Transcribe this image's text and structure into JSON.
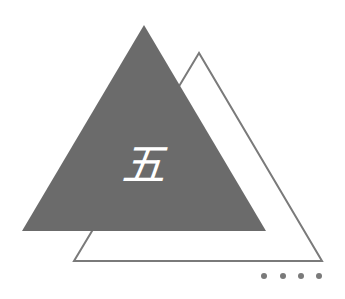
{
  "figure": {
    "character": "五",
    "colors": {
      "background": "#ffffff",
      "filled_triangle": "#6b6b6b",
      "outline_triangle": "#7a7a7a",
      "character": "#ffffff",
      "dots": "#7a7a7a"
    },
    "filled_triangle_points": "144,25 22,231 266,231",
    "outline_triangle_points": "199,53 74,261 322,261",
    "dots_count": 4
  }
}
